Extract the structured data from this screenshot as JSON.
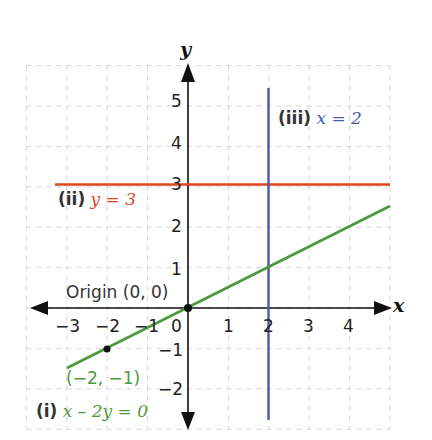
{
  "chart_data": {
    "type": "line",
    "title": "",
    "xlabel": "x",
    "ylabel": "y",
    "xlim": [
      -4,
      5
    ],
    "ylim": [
      -3,
      6
    ],
    "grid": true,
    "x_ticks": [
      "-3",
      "-2",
      "-1",
      "0",
      "1",
      "2",
      "3",
      "4"
    ],
    "y_ticks": [
      "-2",
      "-1",
      "1",
      "2",
      "3",
      "4",
      "5"
    ],
    "series": [
      {
        "name": "(i) x - 2y = 0",
        "equation": "x - 2y = 0",
        "color": "#4a9a3c",
        "points": [
          [
            -3,
            -1.5
          ],
          [
            5,
            2.5
          ]
        ]
      },
      {
        "name": "(ii) y = 3",
        "equation": "y = 3",
        "color": "#e0461e",
        "points": [
          [
            -3.3,
            3
          ],
          [
            5,
            3
          ]
        ]
      },
      {
        "name": "(iii) x = 2",
        "equation": "x = 2",
        "color": "#4b5aa8",
        "points": [
          [
            2,
            -2.75
          ],
          [
            2,
            5.45
          ]
        ]
      }
    ],
    "annotations": [
      {
        "text": "Origin (0, 0)",
        "x": 0,
        "y": 0
      },
      {
        "text": "(-2, -1)",
        "x": -2,
        "y": -1
      }
    ]
  },
  "labels": {
    "axis_x": "x",
    "axis_y": "y",
    "origin": "Origin (0, 0)",
    "point_label": "(−2, −1)",
    "line_i_tag": "(i)",
    "line_i_eq": "x – 2y = 0",
    "line_ii_tag": "(ii)",
    "line_ii_eq": "y = 3",
    "line_iii_tag": "(iii)",
    "line_iii_eq": "x = 2",
    "xt": {
      "m3": "−3",
      "m2": "−2",
      "m1": "−1",
      "z": "0",
      "p1": "1",
      "p2": "2",
      "p3": "3",
      "p4": "4"
    },
    "yt": {
      "m2": "−2",
      "m1": "−1",
      "p1": "1",
      "p2": "2",
      "p3": "3",
      "p4": "4",
      "p5": "5"
    }
  },
  "colors": {
    "green": "#4a9a3c",
    "red": "#e0461e",
    "blue": "#4b5aa8",
    "axis": "#111111",
    "grid": "#d8d8d8"
  }
}
